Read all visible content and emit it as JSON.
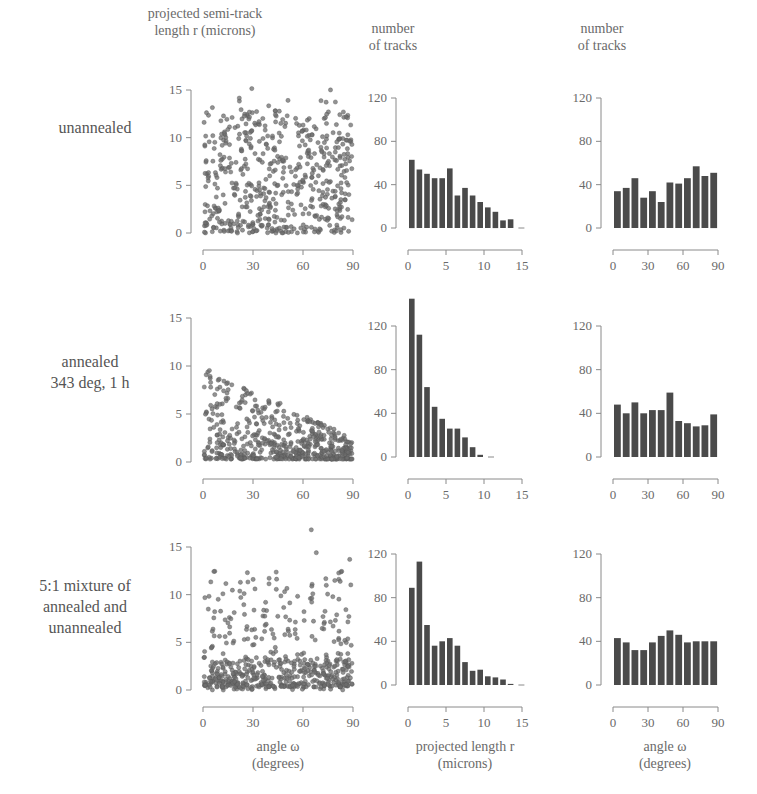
{
  "column_headers": {
    "scatter": [
      "projected semi-track",
      "length r (microns)"
    ],
    "hist_r": [
      "number",
      "of tracks"
    ],
    "hist_omega": [
      "number",
      "of tracks"
    ]
  },
  "row_labels": [
    [
      "unannealed"
    ],
    [
      "annealed",
      "343 deg, 1 h"
    ],
    [
      "5:1 mixture of",
      "annealed and",
      "unannealed"
    ]
  ],
  "bottom_labels": {
    "scatter": [
      "angle  ω",
      "(degrees)"
    ],
    "hist_r": [
      "projected length r",
      "(microns)"
    ],
    "hist_omega": [
      "angle  ω",
      "(degrees)"
    ]
  },
  "colors": {
    "bar": "#4a4a4a",
    "point": "#6e6e6e",
    "axis": "#8a8a8a",
    "text": "#6a6a6a"
  },
  "chart_data": [
    {
      "type": "scatter",
      "row": "unannealed",
      "title": "",
      "xlabel": "angle ω (degrees)",
      "ylabel": "projected semi-track length r (microns)",
      "xlim": [
        0,
        90
      ],
      "ylim": [
        0,
        15
      ],
      "xticks": [
        0,
        30,
        60,
        90
      ],
      "yticks": [
        0,
        5,
        10,
        15
      ],
      "description": "~600 points spread roughly uniformly over r 0-13 and ω 0-90, densest below r=6"
    },
    {
      "type": "bar",
      "row": "unannealed",
      "xlabel": "projected length r (microns)",
      "ylabel": "number of tracks",
      "xlim": [
        0,
        15
      ],
      "ylim": [
        0,
        120
      ],
      "xticks": [
        0,
        5,
        10,
        15
      ],
      "yticks": [
        0,
        40,
        80,
        120
      ],
      "bin_width": 1,
      "categories": [
        0.5,
        1.5,
        2.5,
        3.5,
        4.5,
        5.5,
        6.5,
        7.5,
        8.5,
        9.5,
        10.5,
        11.5,
        12.5,
        13.5
      ],
      "values": [
        63,
        54,
        50,
        46,
        46,
        55,
        30,
        37,
        30,
        24,
        19,
        15,
        7,
        8
      ]
    },
    {
      "type": "bar",
      "row": "unannealed",
      "xlabel": "angle ω (degrees)",
      "ylabel": "number of tracks",
      "xlim": [
        0,
        90
      ],
      "ylim": [
        0,
        120
      ],
      "xticks": [
        0,
        30,
        60,
        90
      ],
      "yticks": [
        0,
        40,
        80,
        120
      ],
      "bin_width": 7.5,
      "categories": [
        3.75,
        11.25,
        18.75,
        26.25,
        33.75,
        41.25,
        48.75,
        56.25,
        63.75,
        71.25,
        78.75,
        86.25
      ],
      "values": [
        34,
        37,
        46,
        28,
        34,
        24,
        42,
        41,
        46,
        57,
        48,
        51
      ]
    },
    {
      "type": "scatter",
      "row": "annealed 343 deg, 1 h",
      "xlabel": "angle ω (degrees)",
      "ylabel": "projected semi-track length r (microns)",
      "xlim": [
        0,
        90
      ],
      "ylim": [
        0,
        15
      ],
      "xticks": [
        0,
        30,
        60,
        90
      ],
      "yticks": [
        0,
        5,
        10,
        15
      ],
      "description": "points concentrated below r=3, with r up to ~10 at low angles decreasing to ~2 near 90°"
    },
    {
      "type": "bar",
      "row": "annealed 343 deg, 1 h",
      "xlabel": "projected length r (microns)",
      "ylabel": "number of tracks",
      "xlim": [
        0,
        15
      ],
      "ylim": [
        0,
        120
      ],
      "xticks": [
        0,
        5,
        10,
        15
      ],
      "yticks": [
        0,
        40,
        80,
        120
      ],
      "bin_width": 1,
      "categories": [
        0.5,
        1.5,
        2.5,
        3.5,
        4.5,
        5.5,
        6.5,
        7.5,
        8.5,
        9.5
      ],
      "values": [
        145,
        112,
        64,
        46,
        35,
        26,
        26,
        18,
        9,
        2
      ]
    },
    {
      "type": "bar",
      "row": "annealed 343 deg, 1 h",
      "xlabel": "angle ω (degrees)",
      "ylabel": "number of tracks",
      "xlim": [
        0,
        90
      ],
      "ylim": [
        0,
        120
      ],
      "xticks": [
        0,
        30,
        60,
        90
      ],
      "yticks": [
        0,
        40,
        80,
        120
      ],
      "bin_width": 7.5,
      "categories": [
        3.75,
        11.25,
        18.75,
        26.25,
        33.75,
        41.25,
        48.75,
        56.25,
        63.75,
        71.25,
        78.75,
        86.25
      ],
      "values": [
        48,
        40,
        50,
        40,
        43,
        43,
        59,
        33,
        31,
        28,
        29,
        39
      ]
    },
    {
      "type": "scatter",
      "row": "5:1 mixture of annealed and unannealed",
      "xlabel": "angle ω (degrees)",
      "ylabel": "projected semi-track length r (microns)",
      "xlim": [
        0,
        90
      ],
      "ylim": [
        0,
        15
      ],
      "xticks": [
        0,
        30,
        60,
        90
      ],
      "yticks": [
        0,
        5,
        10,
        15
      ],
      "description": "dense band below r=3 plus sparser points up to r≈14, a few beyond 15 near ω≈65"
    },
    {
      "type": "bar",
      "row": "5:1 mixture of annealed and unannealed",
      "xlabel": "projected length r (microns)",
      "ylabel": "number of tracks",
      "xlim": [
        0,
        15
      ],
      "ylim": [
        0,
        120
      ],
      "xticks": [
        0,
        5,
        10,
        15
      ],
      "yticks": [
        0,
        40,
        80,
        120
      ],
      "bin_width": 1,
      "categories": [
        0.5,
        1.5,
        2.5,
        3.5,
        4.5,
        5.5,
        6.5,
        7.5,
        8.5,
        9.5,
        10.5,
        11.5,
        12.5,
        13.5
      ],
      "values": [
        89,
        113,
        55,
        36,
        40,
        43,
        36,
        21,
        13,
        14,
        8,
        7,
        5,
        1
      ]
    },
    {
      "type": "bar",
      "row": "5:1 mixture of annealed and unannealed",
      "xlabel": "angle ω (degrees)",
      "ylabel": "number of tracks",
      "xlim": [
        0,
        90
      ],
      "ylim": [
        0,
        120
      ],
      "xticks": [
        0,
        30,
        60,
        90
      ],
      "yticks": [
        0,
        40,
        80,
        120
      ],
      "bin_width": 7.5,
      "categories": [
        3.75,
        11.25,
        18.75,
        26.25,
        33.75,
        41.25,
        48.75,
        56.25,
        63.75,
        71.25,
        78.75,
        86.25
      ],
      "values": [
        43,
        39,
        32,
        32,
        39,
        45,
        50,
        46,
        39,
        40,
        40,
        40
      ]
    }
  ]
}
